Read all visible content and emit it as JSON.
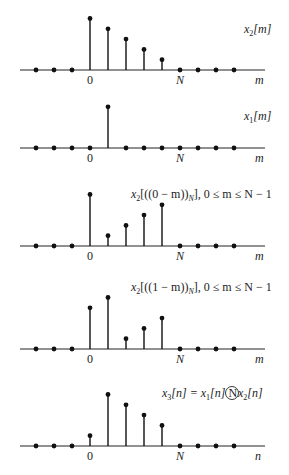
{
  "chart_data": [
    {
      "type": "stem",
      "title": "x2[m]",
      "xlabel": "m",
      "tick_labels": [
        "0",
        "N"
      ],
      "x": [
        -3,
        -2,
        -1,
        0,
        1,
        2,
        3,
        4,
        5,
        6,
        7,
        8
      ],
      "values": [
        0,
        0,
        0,
        5,
        4,
        3,
        2,
        1,
        0,
        0,
        0,
        0
      ]
    },
    {
      "type": "stem",
      "title": "x1[m]",
      "xlabel": "m",
      "tick_labels": [
        "0",
        "N"
      ],
      "x": [
        -3,
        -2,
        -1,
        0,
        1,
        2,
        3,
        4,
        5,
        6,
        7,
        8
      ],
      "values": [
        0,
        0,
        0,
        0,
        4,
        0,
        0,
        0,
        0,
        0,
        0,
        0
      ]
    },
    {
      "type": "stem",
      "title": "x2[((0 − m))N], 0 ≤ m ≤ N − 1",
      "xlabel": "m",
      "tick_labels": [
        "0",
        "N"
      ],
      "x": [
        -3,
        -2,
        -1,
        0,
        1,
        2,
        3,
        4,
        5,
        6,
        7,
        8
      ],
      "values": [
        0,
        0,
        0,
        5,
        1,
        2,
        3,
        4,
        0,
        0,
        0,
        0
      ]
    },
    {
      "type": "stem",
      "title": "x2[((1 − m))N], 0 ≤ m ≤ N − 1",
      "xlabel": "m",
      "tick_labels": [
        "0",
        "N"
      ],
      "x": [
        -3,
        -2,
        -1,
        0,
        1,
        2,
        3,
        4,
        5,
        6,
        7,
        8
      ],
      "values": [
        0,
        0,
        0,
        4,
        5,
        1,
        2,
        3,
        0,
        0,
        0,
        0
      ]
    },
    {
      "type": "stem",
      "title": "x3[n] = x1[n] (N) x2[n]",
      "xlabel": "n",
      "tick_labels": [
        "0",
        "N"
      ],
      "x": [
        -3,
        -2,
        -1,
        0,
        1,
        2,
        3,
        4,
        5,
        6,
        7,
        8
      ],
      "values": [
        0,
        0,
        0,
        1,
        5,
        4,
        3,
        2,
        0,
        0,
        0,
        0
      ]
    }
  ],
  "labels": {
    "p1": {
      "name": "x",
      "sub": "2",
      "arg": "[m]",
      "xaxis": "m",
      "zero": "0",
      "N": "N"
    },
    "p2": {
      "name": "x",
      "sub": "1",
      "arg": "[m]",
      "xaxis": "m",
      "zero": "0",
      "N": "N"
    },
    "p3": {
      "pre": "x",
      "sub": "2",
      "mid": "[((0 − m))",
      "sub2": "N",
      "post": "], 0 ≤ m ≤ N − 1",
      "xaxis": "m",
      "zero": "0",
      "N": "N"
    },
    "p4": {
      "pre": "x",
      "sub": "2",
      "mid": "[((1 − m))",
      "sub2": "N",
      "post": "], 0 ≤ m ≤ N − 1",
      "xaxis": "m",
      "zero": "0",
      "N": "N"
    },
    "p5": {
      "a": "x",
      "asub": "3",
      "aarg": "[n] = ",
      "b": "x",
      "bsub": "1",
      "barg": "[n] ",
      "circ": "N",
      "c": " x",
      "csub": "2",
      "carg": "[n]",
      "xaxis": "n",
      "zero": "0",
      "N": "N"
    }
  }
}
